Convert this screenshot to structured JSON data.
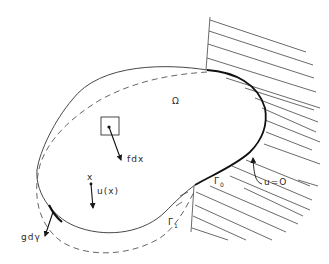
{
  "figure": {
    "colors": {
      "ink": "#2a2a2a",
      "background": "#ffffff",
      "hatch": "#444444",
      "dashed": "#555555"
    }
  },
  "labels": {
    "domain": "Ω",
    "body_force": "fdx",
    "point": "x",
    "displacement": "u(x)",
    "traction": "gdγ",
    "gamma0_main": "Γ",
    "gamma0_sub": "0",
    "gamma1_main": "Γ",
    "gamma1_sub": "1",
    "boundary_condition": "u=O"
  },
  "elements": {
    "solid_boundary": "undeformed boundary of Ω",
    "dashed_boundary": "deformed boundary",
    "bold_boundary": "Γ0 (clamped part)",
    "hatched_region": "rigid support",
    "volume_element": "small square element dx",
    "arrows": [
      "body force arrow",
      "displacement arrow",
      "traction arrow",
      "leader arrow to u=O"
    ]
  }
}
